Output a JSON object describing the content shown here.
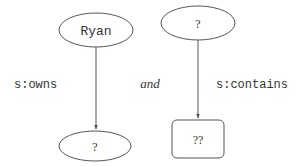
{
  "diagram": {
    "left_graph": {
      "subject": {
        "label": "Ryan",
        "shape": "ellipse"
      },
      "predicate": {
        "label": "s:owns"
      },
      "object": {
        "label": "?",
        "shape": "ellipse"
      }
    },
    "connector": {
      "label": "and"
    },
    "right_graph": {
      "subject": {
        "label": "?",
        "shape": "ellipse"
      },
      "predicate": {
        "label": "s:contains"
      },
      "object": {
        "label": "??",
        "shape": "rounded-rectangle"
      }
    },
    "colors": {
      "stroke": "#555555",
      "text": "#333333",
      "background": "#ffffff"
    }
  }
}
